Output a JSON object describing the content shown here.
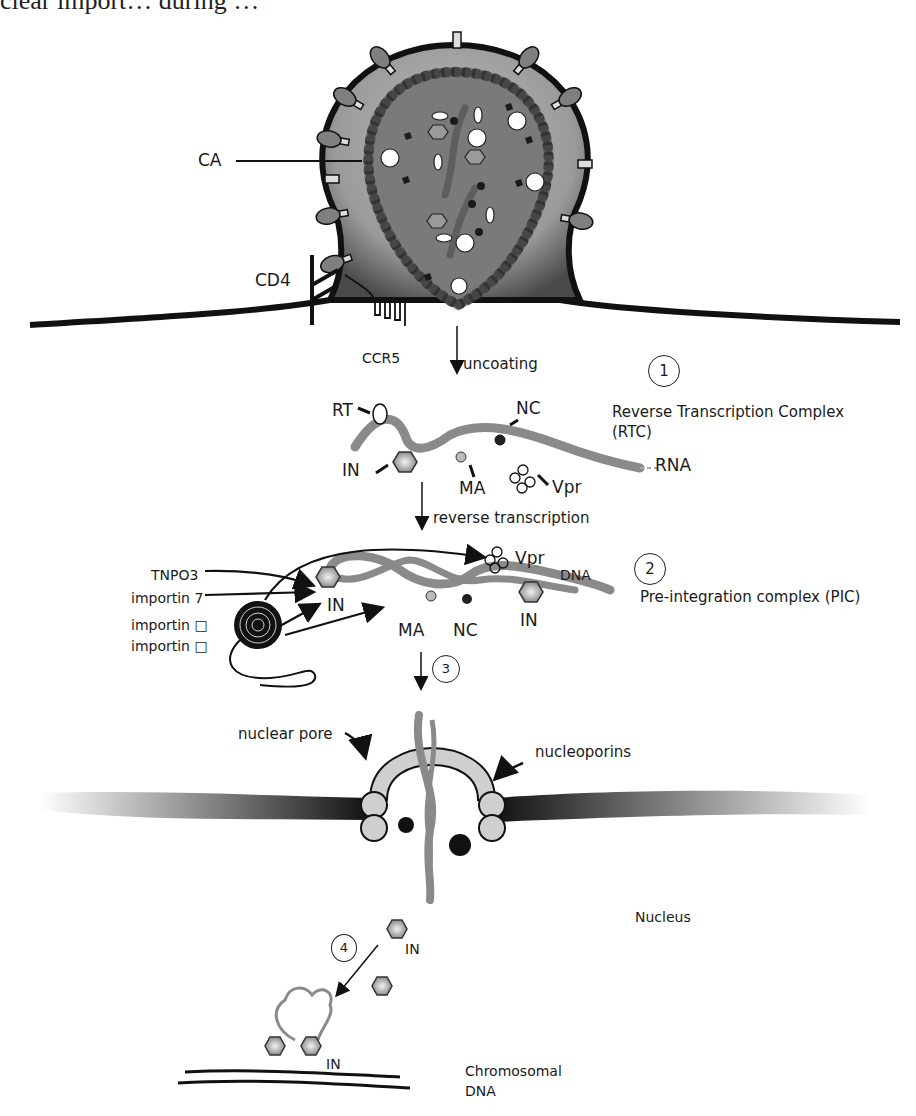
{
  "header_fragment": "clear import… during …",
  "labels": {
    "ca": "CA",
    "cd4": "CD4",
    "ccr5": "CCR5",
    "uncoating": "uncoating",
    "rt": "RT",
    "nc": "NC",
    "in": "IN",
    "ma": "MA",
    "vpr": "Vpr",
    "rna": "RNA",
    "reverse_transcription": "reverse transcription",
    "tnpo3": "TNPO3",
    "importin7": "importin 7",
    "importin_a": "importin □",
    "importin_b": "importin □",
    "dna": "DNA",
    "nuclear_pore": "nuclear pore",
    "nucleoporins": "nucleoporins",
    "nucleus": "Nucleus",
    "chromosomal_dna_line1": "Chromosomal",
    "chromosomal_dna_line2": "DNA"
  },
  "steps": [
    {
      "number": "1",
      "title": "Reverse Transcription Complex",
      "subtitle": "(RTC)"
    },
    {
      "number": "2",
      "title": "Pre-integration complex (PIC)"
    },
    {
      "number": "3"
    },
    {
      "number": "4"
    }
  ],
  "colors": {
    "ink": "#1a1a1a",
    "capsid_fill": "#7a7a7a",
    "capsid_bead": "#555555",
    "membrane_gradient_light": "#e6e6e6",
    "nucleic_acid": "#8a8a8a",
    "nucleoporin": "#cfcfcf"
  }
}
